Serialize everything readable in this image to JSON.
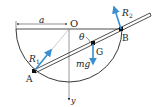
{
  "diagram": {
    "type": "statics-rod-in-hemispherical-bowl",
    "colors": {
      "line": "#222222",
      "force_arrow": "#3a8fd0",
      "thin_line": "#888888",
      "point": "#111111"
    },
    "labels": {
      "origin": "O",
      "radius": "a",
      "point_a": "A",
      "point_b": "B",
      "point_g": "G",
      "angle": "θ",
      "reaction_1": "R",
      "reaction_1_sub": "1",
      "reaction_2": "R",
      "reaction_2_sub": "2",
      "weight": "mg",
      "y_axis": "y"
    }
  }
}
